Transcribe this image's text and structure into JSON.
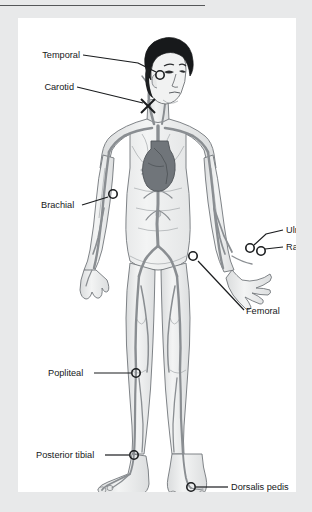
{
  "figure": {
    "panel_background": "#ffffff",
    "page_background": "#e8e9ea",
    "rule_color": "#555759",
    "label_color": "#16181a",
    "leader_color": "#1a1c1e",
    "vessel_color": "#8c9094",
    "body_fill": "#eceded",
    "outline_color": "#6e7275",
    "hair_color": "#17191b",
    "heart_color": "#6b7074"
  },
  "labels": [
    {
      "id": "temporal",
      "text": "Temporal",
      "text_x": 62,
      "text_y": 40,
      "anchor": "end",
      "marker_x": 142,
      "marker_y": 57,
      "marker_type": "circle",
      "leader": [
        [
          65,
          37
        ],
        [
          120,
          45
        ],
        [
          138,
          54
        ]
      ]
    },
    {
      "id": "carotid",
      "text": "Carotid",
      "text_x": 56,
      "text_y": 72,
      "anchor": "end",
      "marker_x": 130,
      "marker_y": 88,
      "marker_type": "cross",
      "leader": [
        [
          59,
          69
        ],
        [
          125,
          85
        ]
      ]
    },
    {
      "id": "brachial",
      "text": "Brachial",
      "text_x": 23,
      "text_y": 190,
      "anchor": "start",
      "marker_x": 95,
      "marker_y": 176,
      "marker_type": "circle",
      "leader": [
        [
          64,
          187
        ],
        [
          90,
          179
        ]
      ]
    },
    {
      "id": "ulnar",
      "text": "Ulnar",
      "text_x": 268,
      "text_y": 215,
      "anchor": "start",
      "marker_x": 232,
      "marker_y": 230,
      "marker_type": "circle",
      "leader": [
        [
          265,
          212
        ],
        [
          248,
          216
        ],
        [
          236,
          227
        ]
      ]
    },
    {
      "id": "radial",
      "text": "Radial",
      "text_x": 268,
      "text_y": 232,
      "anchor": "start",
      "marker_x": 243,
      "marker_y": 233,
      "marker_type": "circle",
      "leader": [
        [
          265,
          229
        ],
        [
          247,
          231
        ]
      ]
    },
    {
      "id": "femoral",
      "text": "Femoral",
      "text_x": 228,
      "text_y": 296,
      "anchor": "start",
      "marker_x": 175,
      "marker_y": 238,
      "marker_type": "circle",
      "leader": [
        [
          226,
          292
        ],
        [
          180,
          243
        ]
      ]
    },
    {
      "id": "popliteal",
      "text": "Popliteal",
      "text_x": 30,
      "text_y": 358,
      "anchor": "start",
      "marker_x": 118,
      "marker_y": 355,
      "marker_type": "circle",
      "leader": [
        [
          76,
          355
        ],
        [
          113,
          355
        ]
      ]
    },
    {
      "id": "posterior-tibial",
      "text": "Posterior tibial",
      "text_x": 18,
      "text_y": 440,
      "anchor": "start",
      "marker_x": 116,
      "marker_y": 437,
      "marker_type": "circle",
      "leader": [
        [
          87,
          437
        ],
        [
          111,
          437
        ]
      ]
    },
    {
      "id": "dorsalis-pedis",
      "text": "Dorsalis pedis",
      "text_x": 213,
      "text_y": 472,
      "anchor": "start",
      "marker_x": 173,
      "marker_y": 469,
      "marker_type": "circle",
      "leader": [
        [
          210,
          469
        ],
        [
          178,
          469
        ]
      ]
    }
  ]
}
